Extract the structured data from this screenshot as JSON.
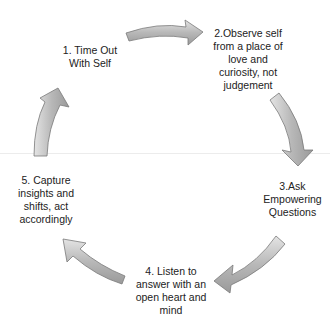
{
  "diagram": {
    "type": "cycle",
    "direction": "clockwise",
    "arrow_color": "#b8b8b8",
    "arrow_outline": "#7a7a7a",
    "text_color": "#222222",
    "steps": [
      {
        "number": 1,
        "label": "1. Time Out\nWith Self"
      },
      {
        "number": 2,
        "label": "2.Observe self\nfrom a place of\nlove and\ncuriosity, not\njudgement"
      },
      {
        "number": 3,
        "label": "3.Ask\nEmpowering\nQuestions"
      },
      {
        "number": 4,
        "label": "4. Listen to\nanswer with an\nopen heart and\nmind"
      },
      {
        "number": 5,
        "label": "5. Capture\ninsights and\nshifts, act\naccordingly"
      }
    ],
    "arrows": [
      {
        "from": 1,
        "to": 2
      },
      {
        "from": 2,
        "to": 3
      },
      {
        "from": 3,
        "to": 4
      },
      {
        "from": 4,
        "to": 5
      },
      {
        "from": 5,
        "to": 1
      }
    ]
  }
}
